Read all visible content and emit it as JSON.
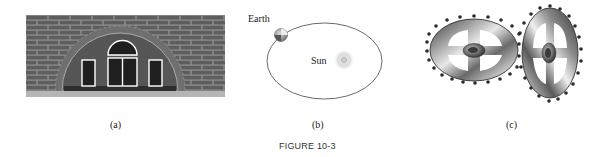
{
  "figure": {
    "title": "FIGURE 10-3",
    "panels": [
      {
        "id": "a",
        "caption": "(a)",
        "description": "Brick wall with semicircular arched window",
        "colors": {
          "brick": "#5e5e5e",
          "mortar": "#8a8a8a",
          "arch_stone": "#6e6e6e",
          "arch_fill": "#555555",
          "window_glass": "#1f1f1f",
          "window_frame": "#ffffff",
          "sill": "#2e2e2e",
          "ground": "#b5b5b5"
        }
      },
      {
        "id": "b",
        "caption": "(b)",
        "description": "Elliptical orbit of Earth around the Sun",
        "labels": {
          "earth": "Earth",
          "sun": "Sun"
        },
        "colors": {
          "orbit": "#6a6a6a",
          "earth": "#9a9a9a",
          "sun_glow": "#dcdcdc",
          "sun_core": "#bdbdbd"
        }
      },
      {
        "id": "c",
        "caption": "(c)",
        "description": "Two meshing metallic gears viewed in perspective",
        "colors": {
          "metal_dark": "#2b2b2b",
          "metal_mid": "#777777",
          "metal_light": "#e6e6e6",
          "teeth": "#2a2a2a"
        }
      }
    ]
  }
}
